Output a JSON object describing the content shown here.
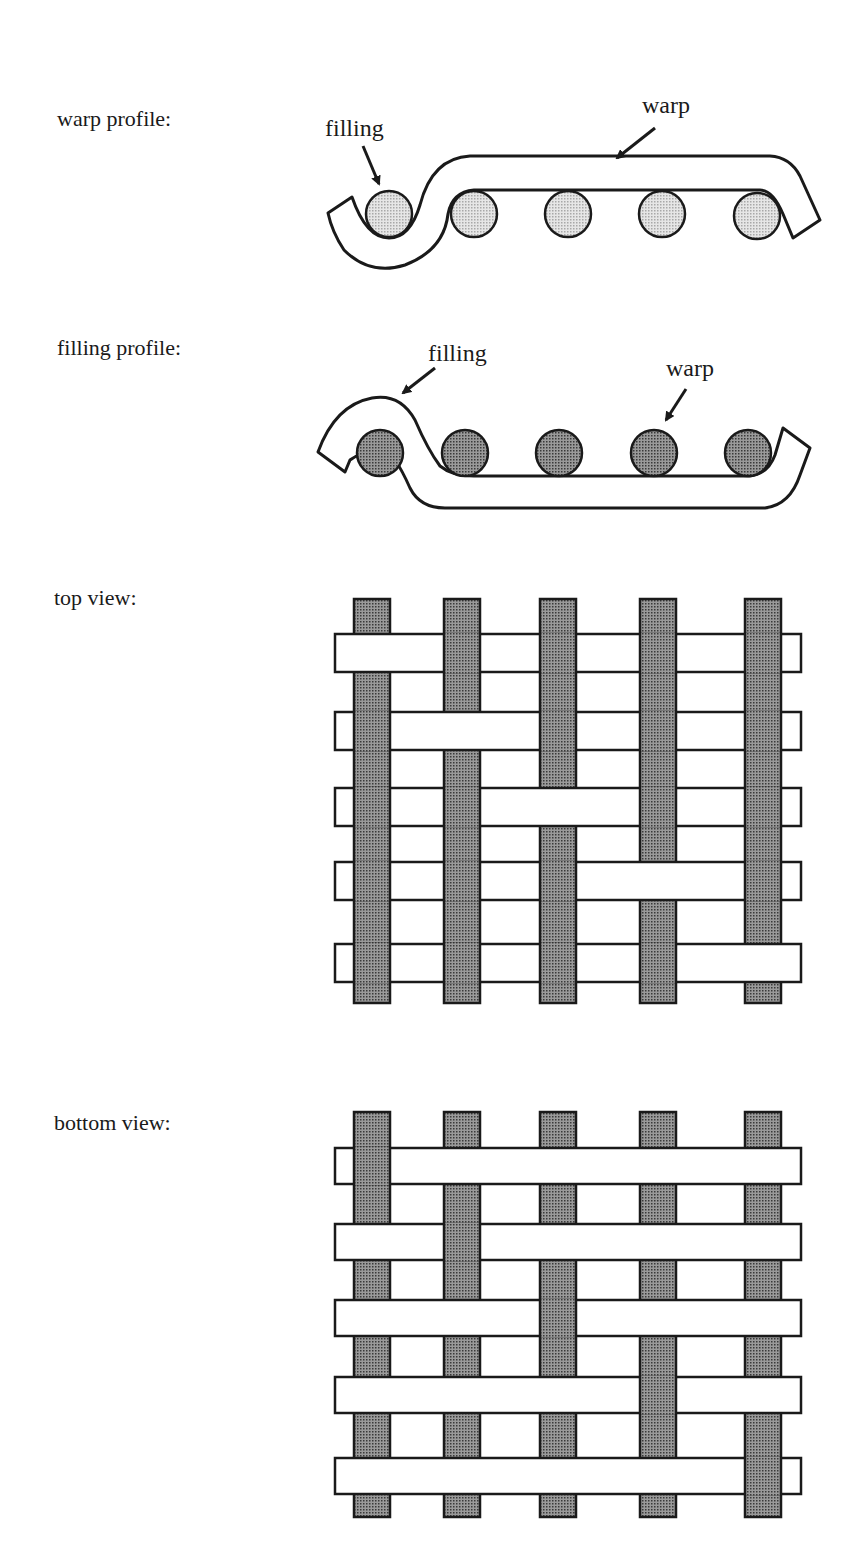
{
  "labels": {
    "warp_profile": "warp profile:",
    "filling_profile": "filling profile:",
    "top_view": "top view:",
    "bottom_view": "bottom view:"
  },
  "annotations": {
    "warp_profile_filling": "filling",
    "warp_profile_warp": "warp",
    "filling_profile_filling": "filling",
    "filling_profile_warp": "warp"
  },
  "colors": {
    "outline": "#1a1a1a",
    "light_dots": "#d4d4d4",
    "dark_dots": "#8a8a8a",
    "yarn_white": "#ffffff"
  },
  "weave": {
    "type": "5-harness satin",
    "columns": 5,
    "rows": 5,
    "top_view_over_warp_index_per_row": [
      0,
      1,
      2,
      3,
      4
    ],
    "bottom_view_under_warp_index_per_row": [
      0,
      1,
      2,
      3,
      4
    ]
  }
}
